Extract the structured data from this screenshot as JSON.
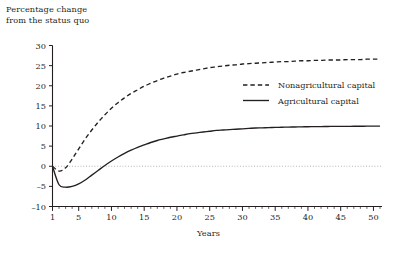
{
  "chart_data": {
    "type": "line",
    "title": "Percentage change\nfrom the status quo",
    "xlabel": "Years",
    "ylabel": "",
    "ylim": [
      -10,
      30
    ],
    "xlim": [
      1,
      51
    ],
    "yticks": [
      -10,
      -5,
      0,
      5,
      10,
      15,
      20,
      25,
      30
    ],
    "ytick_labels": [
      "–10",
      "–5",
      "0",
      "5",
      "10",
      "15",
      "20",
      "25",
      "30"
    ],
    "xticks": [
      1,
      5,
      10,
      15,
      20,
      25,
      30,
      35,
      40,
      45,
      50
    ],
    "xtick_labels": [
      "1",
      "5",
      "10",
      "15",
      "20",
      "25",
      "30",
      "35",
      "40",
      "45",
      "50"
    ],
    "minor_xtick_step": 1,
    "grid": false,
    "zero_reference_line": true,
    "zero_reference_style": "dotted",
    "legend_position": "center-right",
    "x": [
      1,
      2,
      3,
      4,
      5,
      6,
      7,
      8,
      9,
      10,
      11,
      12,
      13,
      14,
      15,
      16,
      17,
      18,
      19,
      20,
      21,
      22,
      23,
      24,
      25,
      26,
      27,
      28,
      29,
      30,
      31,
      32,
      33,
      34,
      35,
      36,
      37,
      38,
      39,
      40,
      41,
      42,
      43,
      44,
      45,
      46,
      47,
      48,
      49,
      50,
      51
    ],
    "series": [
      {
        "name": "Nonagricultural capital",
        "style": "dashed",
        "color": "#231f20",
        "values": [
          0.0,
          -1.2,
          -0.4,
          1.8,
          4.3,
          6.8,
          9.0,
          11.0,
          12.8,
          14.4,
          15.8,
          17.0,
          18.1,
          19.0,
          19.9,
          20.6,
          21.3,
          21.9,
          22.4,
          22.9,
          23.3,
          23.6,
          23.9,
          24.2,
          24.5,
          24.7,
          24.9,
          25.1,
          25.2,
          25.4,
          25.5,
          25.6,
          25.7,
          25.8,
          25.9,
          26.0,
          26.0,
          26.1,
          26.2,
          26.2,
          26.3,
          26.3,
          26.4,
          26.4,
          26.4,
          26.5,
          26.5,
          26.5,
          26.6,
          26.6,
          26.6
        ]
      },
      {
        "name": "Agricultural capital",
        "style": "solid",
        "color": "#231f20",
        "values": [
          0.0,
          -4.6,
          -5.2,
          -5.0,
          -4.4,
          -3.4,
          -2.2,
          -1.0,
          0.2,
          1.3,
          2.3,
          3.2,
          4.0,
          4.7,
          5.3,
          5.9,
          6.4,
          6.8,
          7.2,
          7.5,
          7.8,
          8.1,
          8.3,
          8.5,
          8.7,
          8.9,
          9.0,
          9.1,
          9.2,
          9.3,
          9.4,
          9.5,
          9.55,
          9.6,
          9.65,
          9.7,
          9.73,
          9.76,
          9.79,
          9.82,
          9.84,
          9.86,
          9.88,
          9.9,
          9.91,
          9.92,
          9.93,
          9.94,
          9.95,
          9.96,
          9.97
        ]
      }
    ]
  },
  "legend": {
    "entries": [
      {
        "label": "Nonagricultural capital",
        "style": "dashed"
      },
      {
        "label": "Agricultural capital",
        "style": "solid"
      }
    ]
  }
}
